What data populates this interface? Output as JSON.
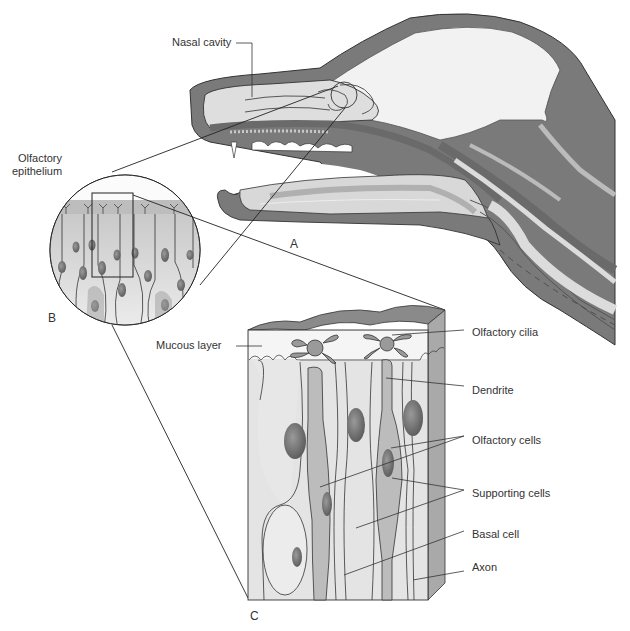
{
  "figure": {
    "panels": {
      "a": "A",
      "b": "B",
      "c": "C"
    },
    "labels": {
      "nasal_cavity": "Nasal cavity",
      "olfactory_epithelium_line1": "Olfactory",
      "olfactory_epithelium_line2": "epithelium",
      "mucous_layer": "Mucous layer",
      "olfactory_cilia": "Olfactory cilia",
      "dendrite": "Dendrite",
      "olfactory_cells": "Olfactory cells",
      "supporting_cells": "Supporting cells",
      "basal_cell": "Basal cell",
      "axon": "Axon"
    },
    "colors": {
      "dark_tissue": "#7a7a7a",
      "mid_tissue": "#b5b5b5",
      "light_tissue": "#dcdcdc",
      "very_light": "#eeeeee",
      "nucleus": "#6e6e6e",
      "outline": "#333333",
      "label_text": "#333333"
    }
  }
}
